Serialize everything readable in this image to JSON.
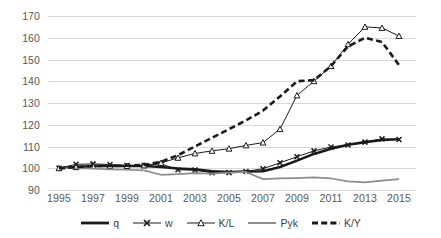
{
  "chart_data": {
    "type": "line",
    "title": "",
    "subtitle": "",
    "xlabel": "",
    "ylabel": "",
    "xlim": [
      1995,
      2015
    ],
    "ylim": [
      90,
      170
    ],
    "yticks": [
      90,
      100,
      110,
      120,
      130,
      140,
      150,
      160,
      170
    ],
    "xticks": [
      1995,
      1997,
      1999,
      2001,
      2003,
      2005,
      2007,
      2009,
      2011,
      2013,
      2015
    ],
    "grid": "horizontal",
    "legend_position": "bottom",
    "x": [
      1995,
      1996,
      1997,
      1998,
      1999,
      2000,
      2001,
      2002,
      2003,
      2004,
      2005,
      2006,
      2007,
      2008,
      2009,
      2010,
      2011,
      2012,
      2013,
      2014,
      2015
    ],
    "series": [
      {
        "name": "q",
        "style": "thick-solid-black",
        "color": "#1a1a1a",
        "marker": "none",
        "values": [
          100.0,
          100.5,
          101.0,
          101.0,
          101.0,
          101.0,
          100.6,
          99.9,
          99.5,
          98.6,
          98.3,
          98.5,
          98.6,
          100.6,
          103.5,
          106.6,
          109.0,
          110.8,
          112.0,
          113.0,
          113.3
        ]
      },
      {
        "name": "w",
        "style": "thin-solid-black-x-markers",
        "color": "#1a1a1a",
        "marker": "x",
        "values": [
          100.0,
          101.8,
          102.0,
          101.7,
          101.3,
          101.2,
          102.0,
          99.3,
          99.2,
          97.9,
          98.0,
          98.5,
          99.8,
          102.5,
          105.3,
          108.0,
          109.8,
          110.7,
          112.0,
          113.5,
          113.2
        ]
      },
      {
        "name": "K/L",
        "style": "thin-solid-black-triangle-markers",
        "color": "#1a1a1a",
        "marker": "triangle",
        "values": [
          100.0,
          100.5,
          101.0,
          101.0,
          101.0,
          101.3,
          102.4,
          104.8,
          106.8,
          108.0,
          109.0,
          110.5,
          111.8,
          118.0,
          133.5,
          140.0,
          147.0,
          157.0,
          165.0,
          164.5,
          160.8
        ]
      },
      {
        "name": "Pyk",
        "style": "medium-solid-gray",
        "color": "#8c8c8c",
        "marker": "none",
        "values": [
          100.0,
          100.0,
          99.8,
          99.5,
          99.3,
          99.0,
          97.0,
          97.3,
          97.8,
          97.5,
          98.0,
          98.3,
          95.0,
          95.3,
          95.5,
          95.8,
          95.3,
          94.0,
          93.5,
          94.3,
          95.0
        ]
      },
      {
        "name": "K/Y",
        "style": "thick-dashed-black",
        "color": "#1a1a1a",
        "marker": "none",
        "values": [
          100.0,
          100.5,
          101.0,
          101.0,
          101.2,
          101.5,
          103.0,
          106.0,
          110.0,
          114.0,
          118.0,
          122.0,
          126.5,
          133.0,
          140.0,
          140.5,
          147.0,
          156.0,
          160.0,
          158.0,
          147.5
        ]
      }
    ]
  },
  "axis": {
    "y_tick_labels": [
      "170",
      "160",
      "150",
      "140",
      "130",
      "120",
      "110",
      "100",
      "90"
    ],
    "x_tick_labels": [
      "1995",
      "1997",
      "1999",
      "2001",
      "2003",
      "2005",
      "2007",
      "2009",
      "2011",
      "2013",
      "2015"
    ]
  },
  "legend": {
    "items": [
      {
        "label": "q",
        "marker_name": "legend-swatch-thick-line"
      },
      {
        "label": "w",
        "marker_name": "legend-swatch-x-marker-line"
      },
      {
        "label": "K/L",
        "marker_name": "legend-swatch-triangle-marker-line"
      },
      {
        "label": "Pyk",
        "marker_name": "legend-swatch-gray-line"
      },
      {
        "label": "K/Y",
        "marker_name": "legend-swatch-dashed-line"
      }
    ]
  },
  "colors": {
    "grid": "#d9d9d9",
    "axis_text": "#575757",
    "legend_text": "#3f3f3f",
    "black_series": "#1a1a1a",
    "gray_series": "#8c8c8c",
    "background": "#ffffff"
  }
}
